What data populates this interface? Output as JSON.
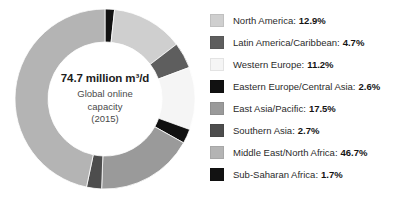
{
  "chart_data": {
    "type": "pie",
    "variant": "donut",
    "title": "",
    "subtitle": "",
    "center_label": {
      "headline": "74.7 million m³/d",
      "lines": [
        "Global online",
        "capacity",
        "(2015)"
      ]
    },
    "units": "%",
    "start_angle_deg": 0,
    "direction": "clockwise",
    "legend_position": "right",
    "grid": false,
    "categories": [
      "North America",
      "Latin America/Caribbean",
      "Western Europe",
      "Eastern Europe/Central Asia",
      "East Asia/Pacific",
      "Southern Asia",
      "Middle East/North Africa",
      "Sub-Saharan Africa"
    ],
    "values": [
      12.9,
      4.7,
      11.2,
      2.6,
      17.5,
      2.7,
      46.7,
      1.7
    ],
    "colors": [
      "#cfcfcf",
      "#5e5e5e",
      "#f5f5f5",
      "#111111",
      "#9a9a9a",
      "#4d4d4d",
      "#b4b4b4",
      "#121212"
    ],
    "slice_order": [
      "Sub-Saharan Africa",
      "North America",
      "Latin America/Caribbean",
      "Western Europe",
      "Eastern Europe/Central Asia",
      "East Asia/Pacific",
      "Southern Asia",
      "Middle East/North Africa"
    ]
  },
  "legend": {
    "items": [
      {
        "label": "North America:",
        "value": "12.9%",
        "color": "#cfcfcf"
      },
      {
        "label": "Latin America/Caribbean:",
        "value": "4.7%",
        "color": "#5e5e5e"
      },
      {
        "label": "Western Europe:",
        "value": "11.2%",
        "color": "#f5f5f5"
      },
      {
        "label": "Eastern Europe/Central Asia:",
        "value": "2.6%",
        "color": "#111111"
      },
      {
        "label": "East Asia/Pacific:",
        "value": "17.5%",
        "color": "#9a9a9a"
      },
      {
        "label": "Southern Asia:",
        "value": "2.7%",
        "color": "#4d4d4d"
      },
      {
        "label": "Middle East/North Africa:",
        "value": "46.7%",
        "color": "#b4b4b4"
      },
      {
        "label": "Sub-Saharan Africa:",
        "value": "1.7%",
        "color": "#121212"
      }
    ]
  }
}
